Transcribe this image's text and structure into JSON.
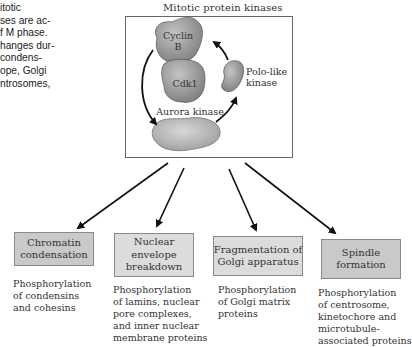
{
  "caption": {
    "text": "itotic\nses are ac-\nf M phase.\nhanges dur-\ncondens-\nope, Golgi\nntrosomes,"
  },
  "kinase_panel": {
    "title": "Mitotic protein kinases",
    "labels": {
      "cyclin": "Cyclin\nB",
      "cdk1": "Cdk1",
      "polo": "Polo-like\nkinase",
      "aurora": "Aurora kinase"
    }
  },
  "outcomes": [
    {
      "label": "Chromatin\ncondensation",
      "description": "Phosphorylation\nof condensins\nand cohesins"
    },
    {
      "label": "Nuclear\nenvelope\nbreakdown",
      "description": "Phosphorylation\nof lamins, nuclear\npore complexes,\nand inner nuclear\nmembrane proteins"
    },
    {
      "label": "Fragmentation of\nGolgi apparatus",
      "description": "Phosphorylation\nof Golgi matrix\nproteins"
    },
    {
      "label": "Spindle\nformation",
      "description": "Phosphorylation\nof centrosome,\nkinetochore and\nmicrotubule-\nassociated proteins"
    }
  ],
  "colors": {
    "box_fill": "#c9c9c9",
    "protein_fill": "#9a9a9a",
    "arrow": "#111111"
  }
}
